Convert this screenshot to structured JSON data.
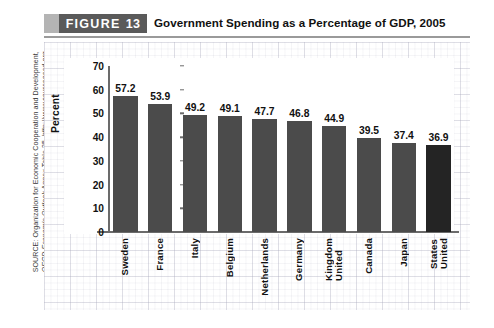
{
  "figure": {
    "banner_word": "FIGURE",
    "banner_number": "13",
    "title": "Government Spending as a Percentage of GDP, 2005"
  },
  "source": {
    "line1": "SOURCE: Organization for Economic Cooperation and Development,",
    "line2_italic": "OECD Economic Outlook",
    "line2_rest": " Annex Table 25, http://www.sourceoecd.org."
  },
  "colors": {
    "bar": "#4b4b4b",
    "bar_highlight": "#242424",
    "banner_box": "#5a5a5a",
    "banner_tab": "#b4b4b4",
    "axis": "#6b6b6b"
  },
  "chart_data": {
    "type": "bar",
    "title": "Government Spending as a Percentage of GDP, 2005",
    "xlabel": "",
    "ylabel": "Percent",
    "ylim": [
      0,
      70
    ],
    "yticks": [
      0,
      10,
      20,
      30,
      40,
      50,
      60,
      70
    ],
    "ytick_labels": [
      "0",
      "10",
      "20",
      "30",
      "40",
      "50",
      "60",
      "70"
    ],
    "grid": false,
    "legend": "none",
    "categories": [
      "Sweden",
      "France",
      "Italy",
      "Belgium",
      "Netherlands",
      "Germany",
      "United Kingdom",
      "Canada",
      "Japan",
      "United States"
    ],
    "category_lines": [
      [
        "Sweden"
      ],
      [
        "France"
      ],
      [
        "Italy"
      ],
      [
        "Belgium"
      ],
      [
        "Netherlands"
      ],
      [
        "Germany"
      ],
      [
        "United",
        "Kingdom"
      ],
      [
        "Canada"
      ],
      [
        "Japan"
      ],
      [
        "United",
        "States"
      ]
    ],
    "values": [
      57.2,
      53.9,
      49.2,
      49.1,
      47.7,
      46.8,
      44.9,
      39.5,
      37.4,
      36.9
    ],
    "value_labels": [
      "57.2",
      "53.9",
      "49.2",
      "49.1",
      "47.7",
      "46.8",
      "44.9",
      "39.5",
      "37.4",
      "36.9"
    ],
    "highlight_index": 9
  }
}
